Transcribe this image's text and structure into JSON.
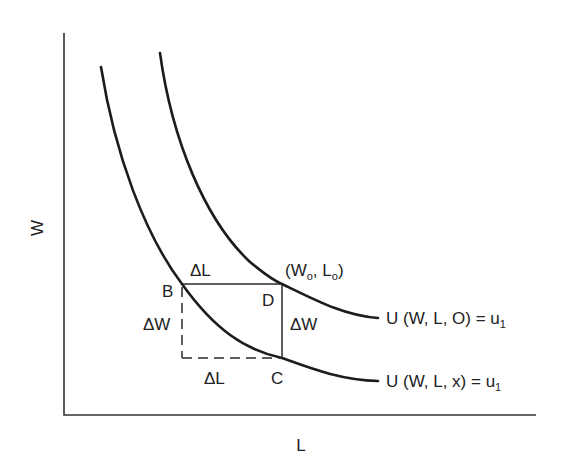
{
  "diagram": {
    "axes": {
      "x_label": "L",
      "y_label": "W"
    },
    "curves": [
      {
        "id": "upper",
        "label": "U (W, L, O) = u",
        "label_sub": "1"
      },
      {
        "id": "lower",
        "label": "U (W, L, x) = u",
        "label_sub": "1"
      }
    ],
    "points": {
      "B": "B",
      "C": "C",
      "D": "D",
      "origin_point": {
        "open": "(W",
        "w_sub": "o",
        "mid": ", L",
        "l_sub": "o",
        "close": ")"
      }
    },
    "deltas": {
      "top_delta_L": "ΔL",
      "bottom_delta_L": "ΔL",
      "left_delta_W": "ΔW",
      "right_delta_W": "ΔW"
    },
    "colors": {
      "line": "#1c1c1c",
      "background": "#ffffff"
    }
  }
}
